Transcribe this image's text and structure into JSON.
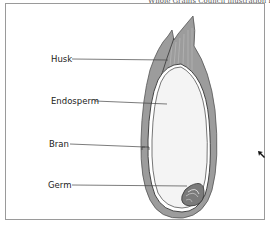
{
  "caption": "Whole Grains Council illustration by Emily McGowan",
  "diagram": {
    "labels": [
      {
        "id": "husk",
        "text": "Husk"
      },
      {
        "id": "endosperm",
        "text": "Endosperm"
      },
      {
        "id": "bran",
        "text": "Bran"
      },
      {
        "id": "germ",
        "text": "Germ"
      }
    ]
  },
  "colors": {
    "frame": "#9a9a9a",
    "husk": "#8f8f8f",
    "bran": "#7a7a7a",
    "endosperm": "#f4f4f4",
    "germ": "#6a6a6a",
    "leader_line": "#444444"
  }
}
